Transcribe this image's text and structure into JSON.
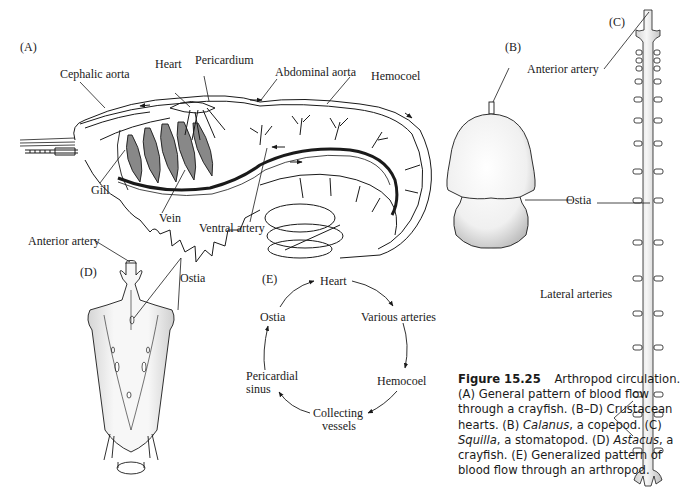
{
  "panels": {
    "A": {
      "label": "(A)",
      "title": "Crayfish circulation",
      "labels": {
        "cephalic_aorta": "Cephalic aorta",
        "heart": "Heart",
        "pericardium": "Pericardium",
        "abdominal_aorta": "Abdominal aorta",
        "hemocoel": "Hemocoel",
        "gill": "Gill",
        "vein": "Vein",
        "ventral_artery": "Ventral artery"
      }
    },
    "B": {
      "label": "(B)",
      "labels": {
        "anterior_artery": "Anterior artery",
        "ostia": "Ostia"
      }
    },
    "C": {
      "label": "(C)",
      "labels": {
        "lateral_arteries": "Lateral arteries"
      }
    },
    "D": {
      "label": "(D)",
      "labels": {
        "anterior_artery": "Anterior artery",
        "ostia": "Ostia"
      }
    },
    "E": {
      "label": "(E)",
      "cycle": [
        "Heart",
        "Various arteries",
        "Hemocoel",
        "Collecting vessels",
        "Pericardial sinus",
        "Ostia"
      ],
      "nodes": {
        "heart": "Heart",
        "various_arteries": "Various arteries",
        "hemocoel": "Hemocoel",
        "collecting_1": "Collecting",
        "collecting_2": "vessels",
        "pericardial_1": "Pericardial",
        "pericardial_2": "sinus",
        "ostia": "Ostia"
      }
    }
  },
  "caption": {
    "figure_number": "Figure 15.25",
    "title": "Arthropod circulation.",
    "a": "(A) General pattern of blood flow through a crayfish.",
    "bd": "(B–D) Crustacean hearts.",
    "b_prefix": "(B)",
    "b_genus": "Calanus",
    "b_rest": ", a copepod.",
    "c_prefix": "(C)",
    "c_genus": "Squilla",
    "c_rest": ", a stomatopod.",
    "d_prefix": "(D)",
    "d_genus": "Astacus",
    "d_rest": ", a crayfish.",
    "e": "(E) Generalized pattern of blood flow through an arthropod."
  }
}
